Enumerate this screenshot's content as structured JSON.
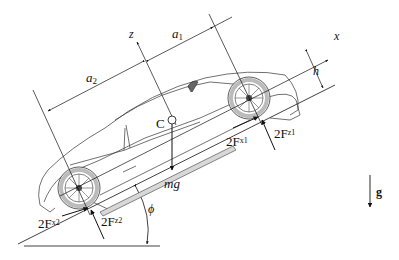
{
  "diagram": {
    "labels": {
      "z_axis": "z",
      "x_axis": "x",
      "a1": "a",
      "a1_sub": "1",
      "a2": "a",
      "a2_sub": "2",
      "h": "h",
      "center": "C",
      "weight": "mg",
      "gravity": "g",
      "angle": "ϕ",
      "fx1_pre": "2F",
      "fx1_sub": "x1",
      "fz1_pre": "2F",
      "fz1_sub": "z1",
      "fx2_pre": "2F",
      "fx2_sub": "x2",
      "fz2_pre": "2F",
      "fz2_sub": "z2"
    },
    "colors": {
      "line": "#111111",
      "tire": "#bbbbbb",
      "background": "#ffffff"
    }
  }
}
